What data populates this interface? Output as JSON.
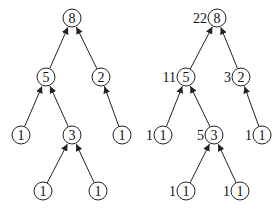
{
  "diagram": {
    "node_radius": 9,
    "stroke_color": "#222222",
    "trees": [
      {
        "id": "left",
        "nodes": [
          {
            "id": "a",
            "value": "8",
            "x": 72,
            "y": 18
          },
          {
            "id": "b",
            "value": "5",
            "x": 46,
            "y": 77
          },
          {
            "id": "c",
            "value": "2",
            "x": 101,
            "y": 77
          },
          {
            "id": "d",
            "value": "1",
            "x": 21,
            "y": 135
          },
          {
            "id": "e",
            "value": "3",
            "x": 72,
            "y": 135
          },
          {
            "id": "f",
            "value": "1",
            "x": 122,
            "y": 135
          },
          {
            "id": "g",
            "value": "1",
            "x": 43,
            "y": 191
          },
          {
            "id": "h",
            "value": "1",
            "x": 98,
            "y": 191
          }
        ],
        "edges": [
          {
            "from": "b",
            "to": "a"
          },
          {
            "from": "c",
            "to": "a"
          },
          {
            "from": "d",
            "to": "b"
          },
          {
            "from": "e",
            "to": "b"
          },
          {
            "from": "f",
            "to": "c"
          },
          {
            "from": "g",
            "to": "e"
          },
          {
            "from": "h",
            "to": "e"
          }
        ]
      },
      {
        "id": "right",
        "nodes": [
          {
            "id": "a",
            "value": "8",
            "x": 217,
            "y": 18,
            "label": "22"
          },
          {
            "id": "b",
            "value": "5",
            "x": 186,
            "y": 77,
            "label": "11"
          },
          {
            "id": "c",
            "value": "2",
            "x": 241,
            "y": 77,
            "label": "3"
          },
          {
            "id": "d",
            "value": "1",
            "x": 163,
            "y": 135,
            "label": "1"
          },
          {
            "id": "e",
            "value": "3",
            "x": 214,
            "y": 135,
            "label": "5"
          },
          {
            "id": "f",
            "value": "1",
            "x": 262,
            "y": 135,
            "label": "1"
          },
          {
            "id": "g",
            "value": "1",
            "x": 186,
            "y": 191,
            "label": "1"
          },
          {
            "id": "h",
            "value": "1",
            "x": 240,
            "y": 191,
            "label": "1"
          }
        ],
        "edges": [
          {
            "from": "b",
            "to": "a"
          },
          {
            "from": "c",
            "to": "a"
          },
          {
            "from": "d",
            "to": "b"
          },
          {
            "from": "e",
            "to": "b"
          },
          {
            "from": "f",
            "to": "c"
          },
          {
            "from": "g",
            "to": "e"
          },
          {
            "from": "h",
            "to": "e"
          }
        ]
      }
    ]
  }
}
